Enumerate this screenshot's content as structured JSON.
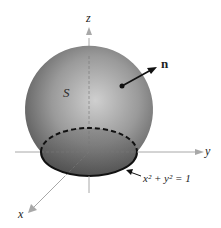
{
  "figure": {
    "surface_label": "S",
    "normal_label": "n",
    "axis_labels": {
      "x": "x",
      "y": "y",
      "z": "z"
    },
    "boundary_equation": "x² + y² = 1",
    "colors": {
      "axis": "#a8a8a8",
      "sphere_light": "#d2d2d2",
      "sphere_dark": "#555555",
      "curve": "#111111"
    }
  }
}
